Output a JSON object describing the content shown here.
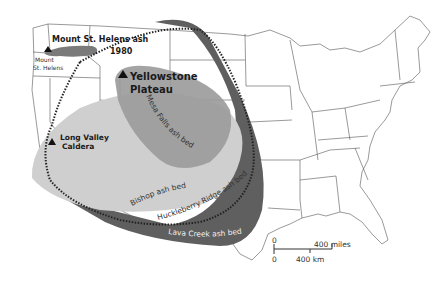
{
  "map": {
    "title": "Ash beds of major volcanic eruptions, western United States",
    "volcanoes": [
      {
        "name": "Mount St. Helens",
        "label": "Mount\nSt. Helens"
      },
      {
        "name": "Yellowstone Plateau",
        "label_line1": "Yellowstone",
        "label_line2": "Plateau"
      },
      {
        "name": "Long Valley Caldera",
        "label_line1": "Long Valley",
        "label_line2": "Caldera"
      }
    ],
    "ash_beds": [
      {
        "name": "Mount St. Helens ash 1980",
        "label_line1": "Mount St. Helens ash",
        "label_line2": "1980",
        "color": "#7a7a7a"
      },
      {
        "name": "Mesa Falls ash bed",
        "label": "Mesa Falls ash bed",
        "color": "#9a9a9a"
      },
      {
        "name": "Bishop ash bed",
        "label": "Bishop ash bed",
        "color": "#cfcfcf"
      },
      {
        "name": "Huckleberry Ridge ash bed",
        "label": "Huckleberry Ridge ash bed",
        "style": "dotted outline"
      },
      {
        "name": "Lava Creek ash bed",
        "label": "Lava Creek ash bed",
        "color": "#5f5f5f"
      }
    ],
    "scale": {
      "zero_top": "0",
      "zero_bottom": "0",
      "miles": "400 miles",
      "km": "400 km"
    }
  },
  "labels": {
    "msh_volcano_line1": "Mount",
    "msh_volcano_line2": "St. Helens",
    "msh_ash_line1": "Mount St. Helens ash",
    "msh_ash_line2": "1980",
    "ys_line1": "Yellowstone",
    "ys_line2": "Plateau",
    "lv_line1": "Long Valley",
    "lv_line2": "Caldera",
    "mesa_falls": "Mesa Falls ash bed",
    "bishop": "Bishop ash bed",
    "huckleberry": "Huckleberry Ridge ash bed",
    "lava_creek": "Lava Creek ash bed"
  }
}
